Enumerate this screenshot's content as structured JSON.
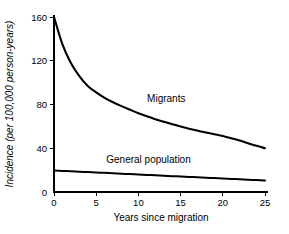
{
  "chart_data": {
    "type": "line",
    "title": "",
    "xlabel": "Years since migration",
    "ylabel": "Incidence (per 100,000 person-years)",
    "xlim": [
      0,
      25
    ],
    "ylim": [
      0,
      160
    ],
    "xticks": [
      "0",
      "5",
      "10",
      "15",
      "20",
      "25"
    ],
    "yticks": [
      "0",
      "40",
      "80",
      "120",
      "160"
    ],
    "grid": false,
    "legend_position": "inline-annotations",
    "x": [
      0,
      1,
      2,
      3,
      4,
      5,
      6,
      7,
      8,
      9,
      10,
      11,
      12,
      13,
      14,
      15,
      16,
      17,
      18,
      19,
      20,
      21,
      22,
      23,
      24,
      25
    ],
    "series": [
      {
        "name": "Migrants",
        "label_x": 13.3,
        "label_y": 82,
        "values": [
          160,
          135,
          118,
          106,
          97,
          91,
          86,
          82,
          78.5,
          75.2,
          72,
          69.2,
          66.6,
          64.2,
          62,
          59.9,
          57.9,
          56.1,
          54.4,
          52.8,
          51.2,
          49.2,
          47.0,
          44.6,
          42.2,
          40
        ]
      },
      {
        "name": "General population",
        "label_x": 11.2,
        "label_y": 27,
        "values": [
          19.7,
          19.3,
          18.9,
          18.6,
          18.2,
          17.8,
          17.5,
          17.1,
          16.7,
          16.4,
          16.0,
          15.6,
          15.3,
          14.9,
          14.5,
          14.2,
          13.8,
          13.4,
          13.1,
          12.7,
          12.3,
          12.0,
          11.6,
          11.2,
          10.9,
          10.5
        ]
      }
    ]
  },
  "colors": {
    "line": "#000000",
    "axis": "#000000",
    "background": "#ffffff"
  }
}
